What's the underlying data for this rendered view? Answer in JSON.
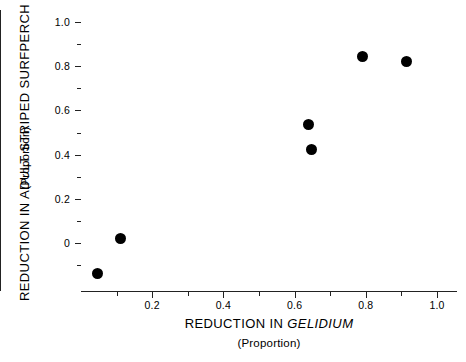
{
  "chart_data": {
    "type": "scatter",
    "title": "",
    "xlabel": "REDUCTION IN GELIDIUM",
    "xlabel_plain": "REDUCTION IN ",
    "xlabel_italic": "GELIDIUM",
    "xsublabel": "(Proportion)",
    "ylabel": "REDUCTION IN ADULT STRIPED SURFPERCH",
    "ysublabel": "(Proportion)",
    "xlim": [
      0.0,
      1.06
    ],
    "ylim": [
      -0.2,
      1.06
    ],
    "grid": false,
    "legend": null,
    "marker_color": "#000000",
    "axis_color": "#222222",
    "xticks_major": [
      "0.2",
      "0.4",
      "0.6",
      "0.8",
      "1.0"
    ],
    "xticks_major_values": [
      0.2,
      0.4,
      0.6,
      0.8,
      1.0
    ],
    "xticks_minor_values": [
      0.1,
      0.3,
      0.5,
      0.7,
      0.9
    ],
    "yticks_major": [
      "1.0",
      "0.8",
      "0.6",
      "0.4",
      "0.2",
      "0"
    ],
    "yticks_major_values": [
      1.0,
      0.8,
      0.6,
      0.4,
      0.2,
      0.0
    ],
    "yticks_minor_values": [
      0.9,
      0.7,
      0.5,
      0.3,
      0.1,
      -0.1
    ],
    "points": [
      {
        "x": 0.045,
        "y": -0.14
      },
      {
        "x": 0.112,
        "y": 0.02
      },
      {
        "x": 0.638,
        "y": 0.535
      },
      {
        "x": 0.648,
        "y": 0.425
      },
      {
        "x": 0.79,
        "y": 0.845
      },
      {
        "x": 0.915,
        "y": 0.82
      }
    ]
  }
}
